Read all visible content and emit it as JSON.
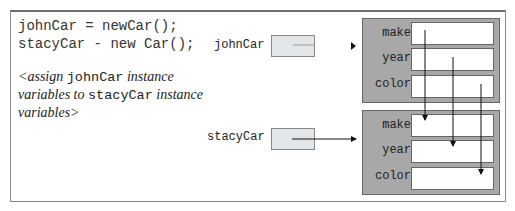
{
  "code": {
    "lines": [
      "johnCar = newCar();",
      "stacyCar - new Car();"
    ]
  },
  "comment": {
    "part1": "<assign ",
    "mono1": "johnCar",
    "part2": " instance variables to ",
    "mono2": "stacyCar",
    "part3": " instance variables>"
  },
  "references": [
    {
      "name": "johnCar"
    },
    {
      "name": "stacyCar"
    }
  ],
  "objects": [
    {
      "fields": [
        "make",
        "year",
        "color"
      ]
    },
    {
      "fields": [
        "make",
        "year",
        "color"
      ]
    }
  ],
  "colors": {
    "object_fill": "#a8a8a8",
    "ref_fill": "#e3e6e8",
    "frame": "#8a8a8a"
  }
}
